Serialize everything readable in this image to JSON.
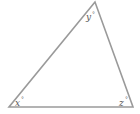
{
  "diagram": {
    "type": "triangle",
    "stroke_color": "#9a9a9a",
    "vertices": {
      "top": [
        95,
        2
      ],
      "bottom_left": [
        9,
        107
      ],
      "bottom_right": [
        133,
        107
      ]
    },
    "angles": [
      {
        "vertex": "bottom_left",
        "variable": "x",
        "unit": "°"
      },
      {
        "vertex": "top",
        "variable": "y",
        "unit": "°"
      },
      {
        "vertex": "bottom_right",
        "variable": "z",
        "unit": "°"
      }
    ]
  }
}
